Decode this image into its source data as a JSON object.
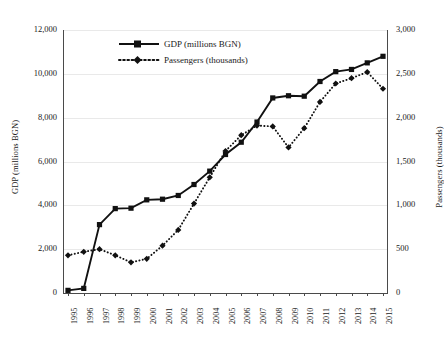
{
  "chart_data": {
    "type": "line",
    "title": "",
    "xlabel": "",
    "categories": [
      "1995",
      "1996",
      "1997",
      "1998",
      "1999",
      "2000",
      "2001",
      "2002",
      "2003",
      "2004",
      "2005",
      "2006",
      "2007",
      "2008",
      "2009",
      "2010",
      "2011",
      "2012",
      "2013",
      "2014",
      "2015"
    ],
    "grid": true,
    "legend_position": "top-left",
    "axes": {
      "left": {
        "label": "GDP (millions BGN)",
        "ticks": [
          "0",
          "2,000",
          "4,000",
          "6,000",
          "8,000",
          "10,000",
          "12,000"
        ],
        "tick_values": [
          0,
          2000,
          4000,
          6000,
          8000,
          10000,
          12000
        ],
        "min": 0,
        "max": 12000
      },
      "right": {
        "label": "Passengers (thousands)",
        "ticks": [
          "0",
          "500",
          "1,000",
          "1,500",
          "2,000",
          "2,500",
          "3,000"
        ],
        "tick_values": [
          0,
          500,
          1000,
          1500,
          2000,
          2500,
          3000
        ],
        "min": 0,
        "max": 3000
      }
    },
    "series": [
      {
        "name": "GDP (millions BGN)",
        "legend_label": "GDP (millions BGN)",
        "axis": "left",
        "line_style": "solid",
        "marker": "square",
        "color": "#111111",
        "values": [
          120,
          210,
          3120,
          3850,
          3870,
          4250,
          4280,
          4450,
          4950,
          5560,
          6320,
          6880,
          7800,
          8900,
          9000,
          8980,
          9650,
          10100,
          10200,
          10500,
          10800
        ]
      },
      {
        "name": "Passengers (thousands)",
        "legend_label": "Passengers (thousands)",
        "axis": "right",
        "line_style": "dotted",
        "marker": "diamond",
        "color": "#111111",
        "values": [
          430,
          470,
          500,
          430,
          350,
          390,
          540,
          720,
          1020,
          1320,
          1620,
          1800,
          1910,
          1900,
          1660,
          1880,
          2180,
          2390,
          2450,
          2520,
          2330
        ]
      }
    ]
  }
}
